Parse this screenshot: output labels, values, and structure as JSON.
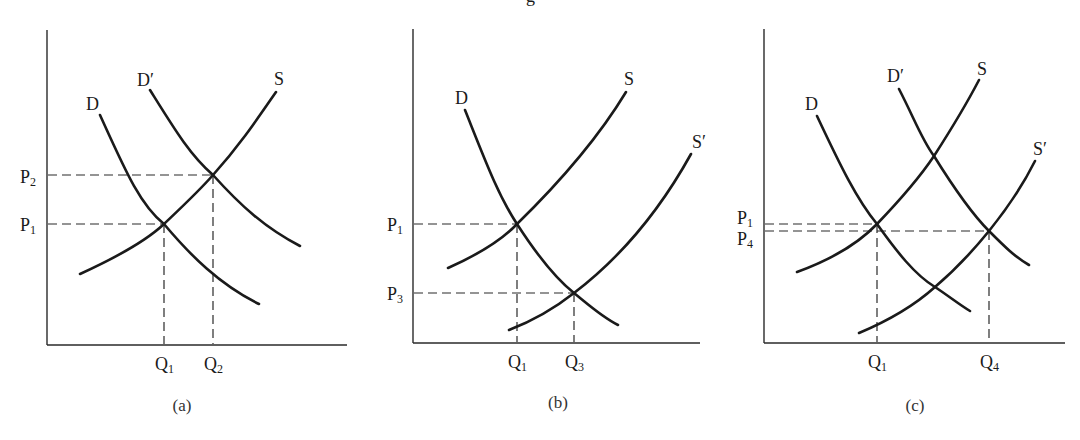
{
  "title_fragment": "g",
  "panels": [
    {
      "id": "a",
      "caption": "(a)",
      "curves": [
        {
          "label": "D",
          "type": "demand"
        },
        {
          "label": "D′",
          "type": "demand-shifted"
        },
        {
          "label": "S",
          "type": "supply"
        }
      ],
      "price_labels": [
        {
          "base": "P",
          "sub": "2"
        },
        {
          "base": "P",
          "sub": "1"
        }
      ],
      "quantity_labels": [
        {
          "base": "Q",
          "sub": "1"
        },
        {
          "base": "Q",
          "sub": "2"
        }
      ]
    },
    {
      "id": "b",
      "caption": "(b)",
      "curves": [
        {
          "label": "D",
          "type": "demand"
        },
        {
          "label": "S",
          "type": "supply"
        },
        {
          "label": "S′",
          "type": "supply-shifted"
        }
      ],
      "price_labels": [
        {
          "base": "P",
          "sub": "1"
        },
        {
          "base": "P",
          "sub": "3"
        }
      ],
      "quantity_labels": [
        {
          "base": "Q",
          "sub": "1"
        },
        {
          "base": "Q",
          "sub": "3"
        }
      ]
    },
    {
      "id": "c",
      "caption": "(c)",
      "curves": [
        {
          "label": "D",
          "type": "demand"
        },
        {
          "label": "D′",
          "type": "demand-shifted"
        },
        {
          "label": "S",
          "type": "supply"
        },
        {
          "label": "S′",
          "type": "supply-shifted"
        }
      ],
      "price_labels": [
        {
          "base": "P",
          "sub": "1"
        },
        {
          "base": "P",
          "sub": "4"
        }
      ],
      "quantity_labels": [
        {
          "base": "Q",
          "sub": "1"
        },
        {
          "base": "Q",
          "sub": "4"
        }
      ]
    }
  ],
  "colors": {
    "line": "#1a1a1a",
    "background": "#ffffff"
  }
}
